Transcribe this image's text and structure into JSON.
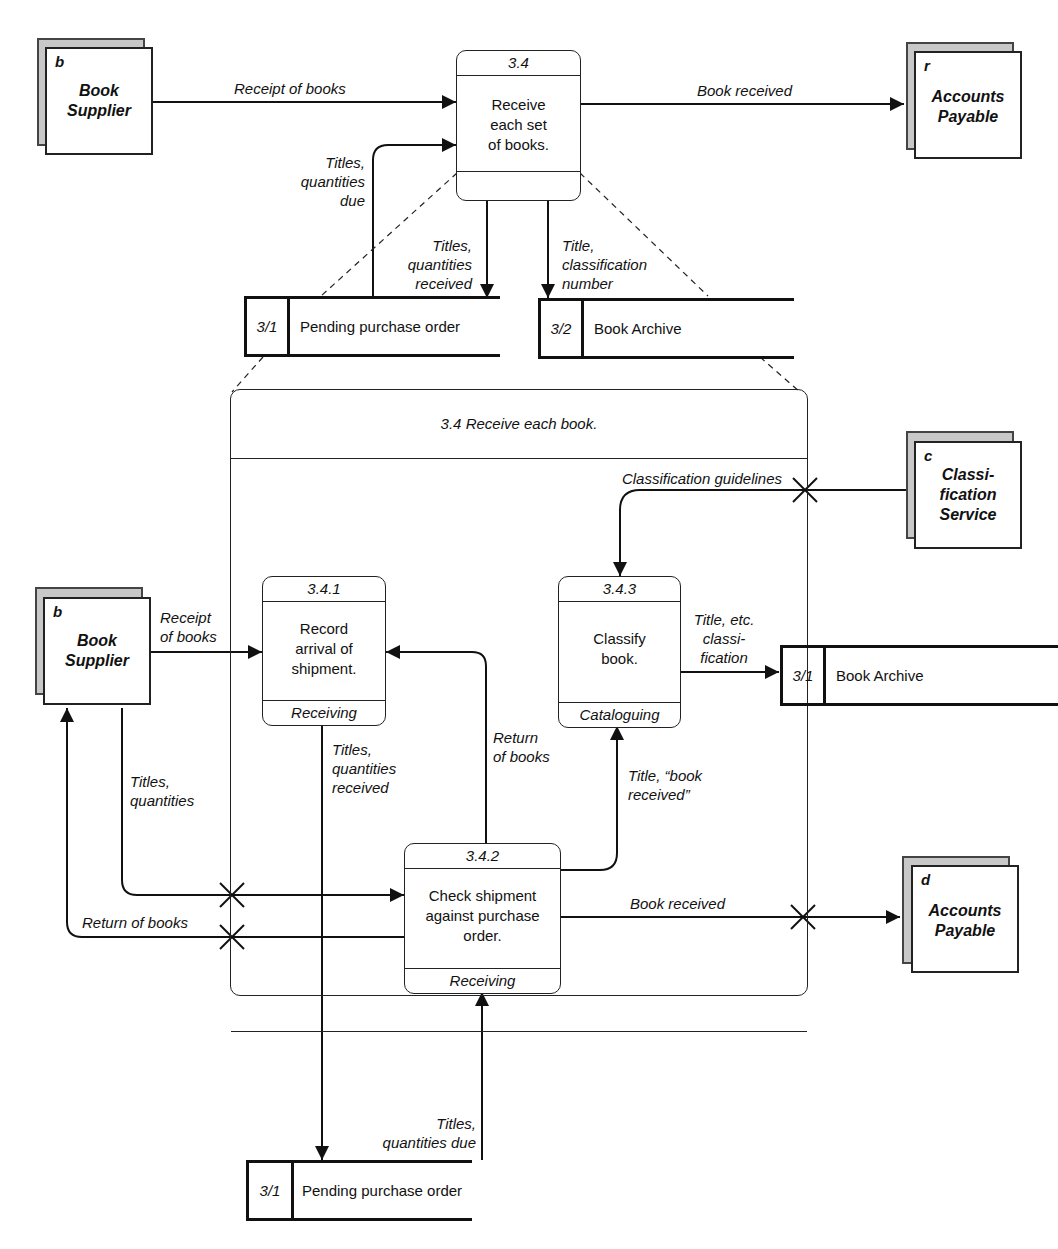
{
  "top_level": {
    "external_entities": [
      {
        "id": "b",
        "name_line1": "Book",
        "name_line2": "Supplier"
      },
      {
        "id": "r",
        "name_line1": "Accounts",
        "name_line2": "Payable"
      }
    ],
    "process": {
      "id": "3.4",
      "line1": "Receive",
      "line2": "each set",
      "line3": "of books.",
      "footer": ""
    },
    "data_stores": [
      {
        "id": "3/1",
        "name": "Pending purchase order"
      },
      {
        "id": "3/2",
        "name": "Book Archive"
      }
    ],
    "flows": {
      "receipt_of_books": "Receipt of books",
      "book_received": "Book received",
      "titles_quantities_due": [
        "Titles,",
        "quantities",
        "due"
      ],
      "titles_quantities_received": [
        "Titles,",
        "quantities",
        "received"
      ],
      "title_classification_number": [
        "Title,",
        "classification",
        "number"
      ]
    }
  },
  "expansion": {
    "title": "3.4 Receive each book.",
    "processes": [
      {
        "id": "3.4.1",
        "lines": [
          "Record",
          "arrival of",
          "shipment."
        ],
        "footer": "Receiving"
      },
      {
        "id": "3.4.2",
        "lines": [
          "Check shipment",
          "against purchase",
          "order."
        ],
        "footer": "Receiving"
      },
      {
        "id": "3.4.3",
        "lines": [
          "Classify",
          "book."
        ],
        "footer": "Cataloguing"
      }
    ],
    "external_entities": [
      {
        "id": "b",
        "name_line1": "Book",
        "name_line2": "Supplier"
      },
      {
        "id": "c",
        "name_line1": "Classi-",
        "name_line2": "fication",
        "name_line3": "Service"
      },
      {
        "id": "d",
        "name_line1": "Accounts",
        "name_line2": "Payable"
      }
    ],
    "data_stores": [
      {
        "id": "3/1",
        "name": "Book Archive"
      },
      {
        "id": "3/1",
        "name": "Pending purchase order"
      }
    ],
    "flows": {
      "classification_guidelines": "Classification guidelines",
      "receipt_of_books": [
        "Receipt",
        "of books"
      ],
      "title_etc_classification": [
        "Title, etc.",
        "classi-",
        "fication"
      ],
      "return_of_books_up": [
        "Return",
        "of books"
      ],
      "titles_quantities_received": [
        "Titles,",
        "quantities",
        "received"
      ],
      "title_book_received": [
        "Title, “book",
        "received”"
      ],
      "titles_quantities": [
        "Titles,",
        "quantities"
      ],
      "return_of_books_left": "Return of books",
      "book_received": "Book received",
      "titles_quantities_due": [
        "Titles,",
        "quantities due"
      ]
    }
  }
}
